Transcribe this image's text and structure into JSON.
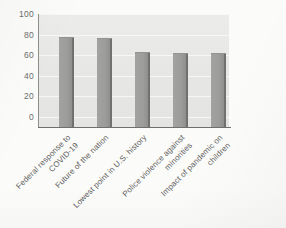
{
  "chart_data": {
    "type": "bar",
    "title": "",
    "subtitle": "",
    "xlabel": "",
    "ylabel": "",
    "categories": [
      "Federal response to\nCOVID-19",
      "Future of the nation",
      "Lowest point in U.S. history",
      "Police violence against\nminorities",
      "Impact of pandemic on\nchildren"
    ],
    "values": [
      87,
      86,
      72,
      71,
      71
    ],
    "ylim": [
      0,
      110
    ],
    "yticks": [
      0,
      20,
      40,
      60,
      80,
      100
    ],
    "ytick_labels": [
      "0",
      "20",
      "40",
      "60",
      "80",
      "100"
    ],
    "grid": "horizontal",
    "legend": "none",
    "orientation": "vertical",
    "bar_color": "#9c9c9a",
    "plot_background": "#e8e8e6",
    "gridline_color": "#f7f7f6",
    "axis_color": "#6f6f6d",
    "label_rotation": -45
  },
  "page": {
    "background": "#fbfbfa"
  }
}
